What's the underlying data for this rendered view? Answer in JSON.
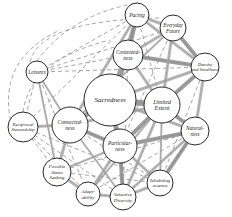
{
  "diagram": {
    "title": "",
    "nodes": [
      {
        "id": "pacing",
        "lines": [
          "Pacing"
        ],
        "x": 137,
        "y": 15,
        "r": 12,
        "fs": 5.5
      },
      {
        "id": "everyday-future",
        "lines": [
          "Everyday",
          "Future"
        ],
        "x": 173,
        "y": 28,
        "r": 13,
        "fs": 5.2
      },
      {
        "id": "contentedness",
        "lines": [
          "Contented-",
          "ness"
        ],
        "x": 128,
        "y": 55,
        "r": 15,
        "fs": 5.4
      },
      {
        "id": "density-smallness",
        "lines": [
          "Density",
          "and Smallness"
        ],
        "x": 205,
        "y": 67,
        "r": 14,
        "fs": 4.8
      },
      {
        "id": "leisures",
        "lines": [
          "Leisures"
        ],
        "x": 37,
        "y": 72,
        "r": 11,
        "fs": 5.2
      },
      {
        "id": "sacredness",
        "lines": [
          "Sacredness"
        ],
        "x": 110,
        "y": 100,
        "r": 26,
        "fs": 7
      },
      {
        "id": "limited-extent",
        "lines": [
          "Limited",
          "Extent"
        ],
        "x": 162,
        "y": 105,
        "r": 18,
        "fs": 5.8
      },
      {
        "id": "reciprocal-stewardship",
        "lines": [
          "Reciprocal",
          "Stewardship"
        ],
        "x": 23,
        "y": 127,
        "r": 15,
        "fs": 4.8
      },
      {
        "id": "connectedness",
        "lines": [
          "Connected-",
          "ness"
        ],
        "x": 70,
        "y": 125,
        "r": 18,
        "fs": 5.4
      },
      {
        "id": "particularness",
        "lines": [
          "Particular-",
          "ness"
        ],
        "x": 120,
        "y": 146,
        "r": 17,
        "fs": 5.4
      },
      {
        "id": "naturalness",
        "lines": [
          "Natural-",
          "ness"
        ],
        "x": 195,
        "y": 131,
        "r": 14,
        "fs": 5.2
      },
      {
        "id": "possible-status-seeking",
        "lines": [
          "Possible",
          "Status",
          "Seeking"
        ],
        "x": 57,
        "y": 172,
        "r": 14,
        "fs": 4.8
      },
      {
        "id": "adaptability",
        "lines": [
          "Adapt-",
          "ability"
        ],
        "x": 88,
        "y": 194,
        "r": 12,
        "fs": 5
      },
      {
        "id": "selective-diversity",
        "lines": [
          "Selective",
          "Diversity"
        ],
        "x": 123,
        "y": 197,
        "r": 13,
        "fs": 5
      },
      {
        "id": "inhabiting-essence",
        "lines": [
          "Inhabiting",
          "essence"
        ],
        "x": 160,
        "y": 183,
        "r": 13,
        "fs": 4.8
      }
    ],
    "edges_strong": [
      [
        "sacredness",
        "contentedness",
        5
      ],
      [
        "sacredness",
        "limited-extent",
        6
      ],
      [
        "sacredness",
        "connectedness",
        5
      ],
      [
        "sacredness",
        "particularness",
        5
      ],
      [
        "sacredness",
        "pacing",
        3
      ],
      [
        "sacredness",
        "density-smallness",
        3
      ],
      [
        "sacredness",
        "naturalness",
        3
      ],
      [
        "contentedness",
        "pacing",
        4
      ],
      [
        "contentedness",
        "everyday-future",
        3
      ],
      [
        "contentedness",
        "density-smallness",
        4
      ],
      [
        "contentedness",
        "limited-extent",
        3
      ],
      [
        "pacing",
        "everyday-future",
        3
      ],
      [
        "pacing",
        "density-smallness",
        3
      ],
      [
        "everyday-future",
        "density-smallness",
        4
      ],
      [
        "everyday-future",
        "limited-extent",
        3
      ],
      [
        "density-smallness",
        "limited-extent",
        4
      ],
      [
        "density-smallness",
        "naturalness",
        3
      ],
      [
        "limited-extent",
        "naturalness",
        4
      ],
      [
        "limited-extent",
        "particularness",
        4
      ],
      [
        "limited-extent",
        "connectedness",
        3
      ],
      [
        "particularness",
        "naturalness",
        4
      ],
      [
        "particularness",
        "connectedness",
        4
      ],
      [
        "particularness",
        "selective-diversity",
        4
      ],
      [
        "particularness",
        "inhabiting-essence",
        3
      ],
      [
        "particularness",
        "adaptability",
        3
      ],
      [
        "naturalness",
        "inhabiting-essence",
        4
      ],
      [
        "naturalness",
        "selective-diversity",
        3
      ],
      [
        "connectedness",
        "reciprocal-stewardship",
        3
      ],
      [
        "connectedness",
        "possible-status-seeking",
        3
      ],
      [
        "connectedness",
        "pacing",
        3
      ],
      [
        "connectedness",
        "everyday-future",
        2
      ],
      [
        "leisures",
        "connectedness",
        2
      ],
      [
        "leisures",
        "possible-status-seeking",
        2
      ],
      [
        "possible-status-seeking",
        "adaptability",
        3
      ],
      [
        "adaptability",
        "selective-diversity",
        3
      ],
      [
        "selective-diversity",
        "inhabiting-essence",
        3
      ],
      [
        "selective-diversity",
        "limited-extent",
        3
      ],
      [
        "inhabiting-essence",
        "limited-extent",
        2
      ],
      [
        "possible-status-seeking",
        "particularness",
        2
      ],
      [
        "adaptability",
        "limited-extent",
        2
      ],
      [
        "connectedness",
        "selective-diversity",
        2
      ]
    ],
    "edges_dashed": [
      [
        "leisures",
        "pacing"
      ],
      [
        "leisures",
        "everyday-future"
      ],
      [
        "leisures",
        "density-smallness"
      ],
      [
        "leisures",
        "contentedness"
      ],
      [
        "leisures",
        "reciprocal-stewardship"
      ],
      [
        "leisures",
        "adaptability"
      ],
      [
        "reciprocal-stewardship",
        "pacing"
      ],
      [
        "reciprocal-stewardship",
        "possible-status-seeking"
      ],
      [
        "reciprocal-stewardship",
        "adaptability"
      ],
      [
        "reciprocal-stewardship",
        "selective-diversity"
      ],
      [
        "reciprocal-stewardship",
        "inhabiting-essence"
      ],
      [
        "possible-status-seeking",
        "naturalness"
      ],
      [
        "possible-status-seeking",
        "inhabiting-essence"
      ],
      [
        "adaptability",
        "naturalness"
      ],
      [
        "connectedness",
        "inhabiting-essence"
      ],
      [
        "contentedness",
        "selective-diversity"
      ],
      [
        "everyday-future",
        "particularness"
      ],
      [
        "density-smallness",
        "inhabiting-essence"
      ],
      [
        "pacing",
        "limited-extent"
      ],
      [
        "naturalness",
        "inhabiting-essence"
      ]
    ],
    "arcs_dashed": [
      "M 37 61 Q 70 15 137 3",
      "M 30 62 Q 40 20 160 18",
      "M 12 127 Q -5 60 60 30",
      "M 23 112 Q 30 60 110 40"
    ]
  }
}
